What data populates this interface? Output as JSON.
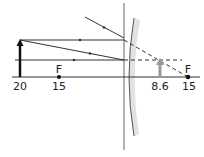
{
  "diagram": {
    "type": "ray-diagram",
    "axis_labels": {
      "object_distance": "20",
      "focal_left_distance": "15",
      "image_distance": "8.6",
      "focal_right_distance": "15"
    },
    "focal_labels": {
      "left": "F",
      "right": "F"
    },
    "colors": {
      "ray": "#333333",
      "object_arrow": "#111111",
      "image_arrow": "#999999",
      "lens_fill": "#e2e2e2",
      "lens_edge": "#555555"
    }
  }
}
